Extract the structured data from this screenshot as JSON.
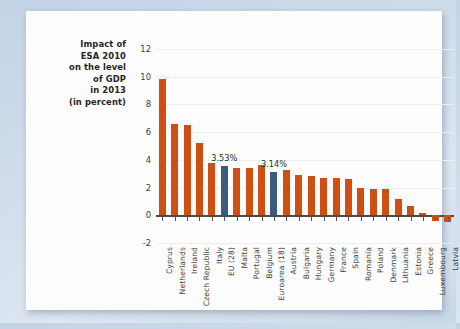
{
  "card": {
    "title_lines": [
      "Impact of",
      "ESA 2010",
      "on the level",
      "of GDP",
      "in 2013",
      "(in percent)"
    ]
  },
  "colors": {
    "bar": "#cf4f12",
    "highlight_bar": "#3c5c7c",
    "grid": "#eceff2",
    "axis": "#4a4a4a",
    "page_background": "#cbd9e9",
    "card_background": "#fdfdfd"
  },
  "chart_data": {
    "type": "bar",
    "xlabel": "",
    "ylabel": "",
    "ylim": [
      -2,
      12
    ],
    "yticks": [
      -2,
      0,
      2,
      4,
      6,
      8,
      10,
      12
    ],
    "grid": true,
    "legend": "none",
    "categories": [
      "Cyprus",
      "Netherlands",
      "Ireland",
      "Czech Republic",
      "Italy",
      "EU (28)",
      "Malta",
      "Portugal",
      "Belgium",
      "Euroarea (18)",
      "Austria",
      "Bulgaria",
      "Hungary",
      "Germany",
      "France",
      "Spain",
      "Romania",
      "Poland",
      "Denmark",
      "Lithuania",
      "Estonia",
      "Greece",
      "Luxembourg",
      "Latvia"
    ],
    "values": [
      9.8,
      6.6,
      6.5,
      5.2,
      3.8,
      3.53,
      3.4,
      3.4,
      3.6,
      3.14,
      3.3,
      2.9,
      2.8,
      2.7,
      2.7,
      2.65,
      2.0,
      1.9,
      1.9,
      1.2,
      0.7,
      0.2,
      -0.4,
      -0.5
    ],
    "highlighted": [
      "EU (28)",
      "Euroarea (18)"
    ],
    "annotations": [
      {
        "category": "EU (28)",
        "text": "3.53%"
      },
      {
        "category": "Euroarea (18)",
        "text": "3.14%"
      }
    ]
  }
}
